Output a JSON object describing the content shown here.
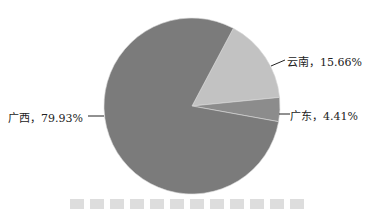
{
  "chart_data": {
    "type": "pie",
    "title": "",
    "categories": [
      "广西",
      "云南",
      "广东"
    ],
    "values": [
      79.93,
      15.66,
      4.41
    ],
    "unit": "%",
    "labels": [
      "广西，79.93%",
      "云南，15.66%",
      "广东，4.41%"
    ],
    "colors": [
      "#7b7b7b",
      "#c2c2c2",
      "#8c8c8c"
    ],
    "legend": "none",
    "label_style": "leader-lines"
  }
}
